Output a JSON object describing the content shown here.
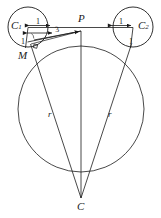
{
  "figure": {
    "type": "geometry-diagram",
    "width": 161,
    "height": 218,
    "background_color": "#ffffff",
    "stroke_color": "#1a1a1a"
  },
  "labels": {
    "center_left": "C",
    "center_left_sub": "1",
    "center_right": "C",
    "center_right_sub": "2",
    "point_p": "P",
    "point_m": "M",
    "point_c": "C",
    "radius_left": "r",
    "radius_right": "r"
  },
  "dimensions": {
    "left_unit": "1",
    "right_unit": "1",
    "left_radius_mark": "1",
    "right_radius_mark": "1",
    "segment_three": "3"
  },
  "geometry": {
    "circle_left": {
      "cx": 28,
      "cy": 27,
      "r": 20
    },
    "circle_right": {
      "cx": 133,
      "cy": 27,
      "r": 20
    },
    "circle_big": {
      "cx": 81,
      "cy": 109,
      "r": 63
    },
    "point_p": {
      "x": 81,
      "y": 32
    },
    "point_m": {
      "x": 31,
      "y": 49
    },
    "point_c": {
      "x": 81,
      "y": 198
    },
    "tangent_left_end": {
      "x": 28,
      "y": 27
    },
    "tangent_right_end": {
      "x": 133,
      "y": 27
    }
  },
  "annotations": {
    "right_angle_marker": "right-angle",
    "arrow_heads": "dimension-arrows"
  }
}
